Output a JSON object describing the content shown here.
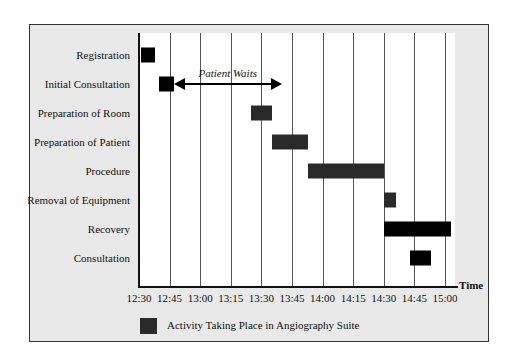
{
  "chart_data": {
    "type": "gantt",
    "title": "",
    "xlabel": "Time",
    "ylabel": "",
    "x_ticks": [
      "12:30",
      "12:45",
      "13:00",
      "13:15",
      "13:30",
      "13:45",
      "14:00",
      "14:15",
      "14:30",
      "14:45",
      "15:00"
    ],
    "xlim": [
      "12:30",
      "15:05"
    ],
    "grid": true,
    "grid_interval_minutes": 15,
    "categories": [
      "Registration",
      "Initial Consultation",
      "Preparation of Room",
      "Preparation of Patient",
      "Procedure",
      "Removal of Equipment",
      "Recovery",
      "Consultation"
    ],
    "tasks": [
      {
        "name": "Registration",
        "start": "12:30",
        "end": "12:37",
        "in_suite": false
      },
      {
        "name": "Initial Consultation",
        "start": "12:40",
        "end": "12:47",
        "in_suite": false
      },
      {
        "name": "Preparation of Room",
        "start": "13:25",
        "end": "13:35",
        "in_suite": true
      },
      {
        "name": "Preparation of Patient",
        "start": "13:35",
        "end": "13:53",
        "in_suite": true
      },
      {
        "name": "Procedure",
        "start": "13:53",
        "end": "14:30",
        "in_suite": true
      },
      {
        "name": "Removal of Equipment",
        "start": "14:30",
        "end": "14:36",
        "in_suite": true
      },
      {
        "name": "Recovery",
        "start": "14:30",
        "end": "15:03",
        "in_suite": false
      },
      {
        "name": "Consultation",
        "start": "14:43",
        "end": "14:53",
        "in_suite": false
      }
    ],
    "annotations": [
      {
        "text": "Patient Waits",
        "type": "double-arrow",
        "row": "Initial Consultation",
        "from": "12:47",
        "to": "13:40"
      }
    ],
    "legend": [
      {
        "label": "Activity Taking Place in Angiography Suite",
        "color": "#2a2a2a"
      }
    ],
    "legend_position": "bottom-left",
    "colors": {
      "suite": "#2a2a2a",
      "other": "#000000",
      "frame_bg": "#e9e9e9",
      "plot_bg": "#ffffff"
    }
  },
  "labels": {
    "time_axis": "Time",
    "patient_waits": "Patient Waits",
    "legend": "Activity Taking Place in Angiography Suite"
  }
}
